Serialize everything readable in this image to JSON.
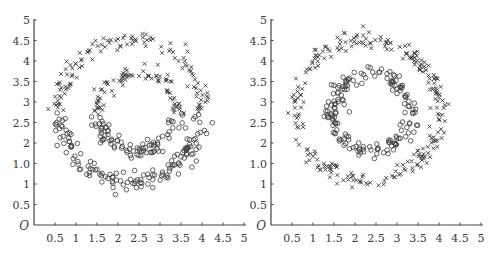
{
  "figure": {
    "panels": [
      {
        "id": "left",
        "origin_label": "O",
        "y_tick_labels": [
          "0.5",
          "1",
          "1.0",
          "2",
          "2.5",
          "3",
          "3.5",
          "4",
          "4.5",
          "5"
        ],
        "x_tick_labels": [
          "0.5",
          "1",
          "1.5",
          "2",
          "2.5",
          "3",
          "3.5",
          "4",
          "4.5",
          "5"
        ]
      },
      {
        "id": "right",
        "origin_label": "O",
        "y_tick_labels": [
          "0.5",
          "1",
          "1.0",
          "2",
          "2.5",
          "3",
          "3.5",
          "4",
          "4.5",
          "5"
        ],
        "x_tick_labels": [
          "0.5",
          "1",
          "1.5",
          "2",
          "2.5",
          "3",
          "3.5",
          "4",
          "4.5",
          "5"
        ]
      }
    ],
    "colors": {
      "axis": "#444444",
      "marker": "#3c3c3c",
      "text": "#3a3a3a",
      "background": "#ffffff"
    }
  },
  "chart_data": [
    {
      "type": "scatter",
      "title": "",
      "xlabel": "",
      "ylabel": "",
      "xlim": [
        0,
        5
      ],
      "ylim": [
        0,
        5
      ],
      "x_ticks": [
        0.5,
        1,
        1.5,
        2,
        2.5,
        3,
        3.5,
        4,
        4.5,
        5
      ],
      "y_ticks": [
        0.5,
        1,
        1.5,
        2,
        2.5,
        3,
        3.5,
        4,
        4.5,
        5
      ],
      "y_tick_labels": [
        "0.5",
        "1",
        "1.0",
        "2",
        "2.5",
        "3",
        "3.5",
        "4",
        "4.5",
        "5"
      ],
      "origin_label": "O",
      "grid": false,
      "legend": null,
      "description": "Two concentric noisy rings; points split by a horizontal boundary near y=2.7 (upper = x markers, lower = o markers) — a poor clustering result",
      "rings": [
        {
          "name": "outer",
          "center": [
            2.3,
            2.8
          ],
          "radius": 1.72,
          "noise": 0.1,
          "n": 260
        },
        {
          "name": "inner",
          "center": [
            2.45,
            2.75
          ],
          "radius": 0.95,
          "noise": 0.1,
          "n": 170
        }
      ],
      "assignment_rule": "y_above_2.7_is_cross",
      "series": [
        {
          "name": "cluster A",
          "marker": "x",
          "sample_points": [
            [
              0.6,
              3.0
            ],
            [
              0.8,
              3.3
            ],
            [
              1.0,
              3.6
            ],
            [
              1.2,
              3.9
            ],
            [
              1.5,
              4.15
            ],
            [
              1.8,
              4.35
            ],
            [
              2.1,
              4.5
            ],
            [
              2.4,
              4.45
            ],
            [
              2.8,
              4.35
            ],
            [
              3.1,
              4.15
            ],
            [
              3.4,
              3.9
            ],
            [
              3.7,
              3.5
            ],
            [
              3.9,
              3.1
            ],
            [
              1.6,
              3.0
            ],
            [
              1.8,
              3.4
            ],
            [
              2.0,
              3.6
            ],
            [
              2.3,
              3.75
            ],
            [
              2.6,
              3.6
            ],
            [
              2.9,
              3.4
            ],
            [
              3.2,
              3.05
            ]
          ]
        },
        {
          "name": "cluster B",
          "marker": "o",
          "sample_points": [
            [
              0.65,
              2.5
            ],
            [
              0.8,
              2.1
            ],
            [
              1.0,
              1.9
            ],
            [
              1.3,
              1.6
            ],
            [
              1.5,
              1.35
            ],
            [
              1.8,
              1.15
            ],
            [
              2.1,
              1.05
            ],
            [
              2.5,
              1.05
            ],
            [
              2.9,
              1.1
            ],
            [
              3.3,
              1.3
            ],
            [
              3.6,
              1.6
            ],
            [
              3.9,
              2.0
            ],
            [
              4.0,
              2.5
            ],
            [
              1.55,
              2.5
            ],
            [
              1.7,
              2.2
            ],
            [
              2.0,
              1.95
            ],
            [
              2.4,
              1.85
            ],
            [
              2.8,
              1.95
            ],
            [
              3.1,
              2.2
            ],
            [
              3.3,
              2.5
            ]
          ]
        }
      ]
    },
    {
      "type": "scatter",
      "title": "",
      "xlabel": "",
      "ylabel": "",
      "xlim": [
        0,
        5
      ],
      "ylim": [
        0,
        5
      ],
      "x_ticks": [
        0.5,
        1,
        1.5,
        2,
        2.5,
        3,
        3.5,
        4,
        4.5,
        5
      ],
      "y_ticks": [
        0.5,
        1,
        1.5,
        2,
        2.5,
        3,
        3.5,
        4,
        4.5,
        5
      ],
      "y_tick_labels": [
        "0.5",
        "1",
        "1.0",
        "2",
        "2.5",
        "3",
        "3.5",
        "4",
        "4.5",
        "5"
      ],
      "origin_label": "O",
      "grid": false,
      "legend": null,
      "description": "Two concentric noisy rings correctly clustered: outer ring = x markers, inner ring = o markers",
      "rings": [
        {
          "name": "outer",
          "center": [
            2.3,
            2.8
          ],
          "radius": 1.72,
          "noise": 0.1,
          "n": 260
        },
        {
          "name": "inner",
          "center": [
            2.4,
            2.75
          ],
          "radius": 0.95,
          "noise": 0.1,
          "n": 170
        }
      ],
      "assignment_rule": "outer_is_cross_inner_is_circle",
      "series": [
        {
          "name": "outer ring",
          "marker": "x",
          "sample_points": [
            [
              0.6,
              3.0
            ],
            [
              0.7,
              2.5
            ],
            [
              0.9,
              2.0
            ],
            [
              1.2,
              1.6
            ],
            [
              1.5,
              1.3
            ],
            [
              1.9,
              1.1
            ],
            [
              2.3,
              1.05
            ],
            [
              2.8,
              1.1
            ],
            [
              3.2,
              1.35
            ],
            [
              3.5,
              1.7
            ],
            [
              3.7,
              2.1
            ],
            [
              3.85,
              2.6
            ],
            [
              3.8,
              3.1
            ],
            [
              3.5,
              3.6
            ],
            [
              3.1,
              4.05
            ],
            [
              2.7,
              4.3
            ],
            [
              2.1,
              4.5
            ],
            [
              1.6,
              4.25
            ],
            [
              1.2,
              3.9
            ],
            [
              0.85,
              3.4
            ]
          ]
        },
        {
          "name": "inner ring",
          "marker": "o",
          "sample_points": [
            [
              1.5,
              2.9
            ],
            [
              1.55,
              2.4
            ],
            [
              1.75,
              2.05
            ],
            [
              2.0,
              1.85
            ],
            [
              2.3,
              1.8
            ],
            [
              2.7,
              1.85
            ],
            [
              3.0,
              2.1
            ],
            [
              3.2,
              2.5
            ],
            [
              3.2,
              2.95
            ],
            [
              3.0,
              3.3
            ],
            [
              2.7,
              3.55
            ],
            [
              2.3,
              3.7
            ],
            [
              1.9,
              3.55
            ],
            [
              1.65,
              3.25
            ]
          ]
        }
      ]
    }
  ]
}
